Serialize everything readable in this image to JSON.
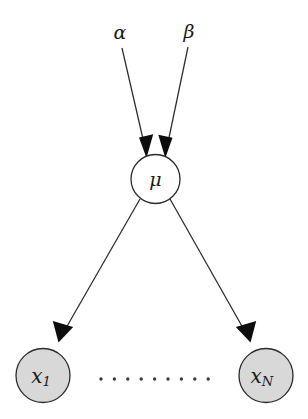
{
  "diagram": {
    "type": "directed-graphical-model",
    "background_color": "#ffffff",
    "stroke_color": "#2b2b2b",
    "arrow_color": "#0d0d0d",
    "shaded_node_fill": "#d8d8d8",
    "open_node_fill": "#ffffff"
  },
  "parameters": [
    {
      "id": "alpha",
      "label": "α",
      "x": 120,
      "y": 33,
      "font_size": 19
    },
    {
      "id": "beta",
      "label": "β",
      "x": 189,
      "y": 32,
      "font_size": 19
    }
  ],
  "nodes": [
    {
      "id": "mu",
      "label": "μ",
      "subscript": "",
      "cx": 155.5,
      "cy": 179,
      "r": 24.5,
      "shaded": false,
      "font_size": 19,
      "observed": false
    },
    {
      "id": "x1",
      "label": "x",
      "subscript": "1",
      "cx": 43,
      "cy": 375.5,
      "r": 27,
      "shaded": true,
      "font_size": 20,
      "observed": true
    },
    {
      "id": "xN",
      "label": "x",
      "subscript": "N",
      "cx": 266,
      "cy": 375.5,
      "r": 27,
      "shaded": true,
      "font_size": 20,
      "observed": true
    }
  ],
  "edges": [
    {
      "id": "alpha-to-mu",
      "from": "alpha",
      "to": "mu",
      "x1": 122,
      "y1": 48,
      "x2": 146,
      "y2": 156,
      "arrow": true
    },
    {
      "id": "beta-to-mu",
      "from": "beta",
      "to": "mu",
      "x1": 188,
      "y1": 47,
      "x2": 166,
      "y2": 156,
      "arrow": true
    },
    {
      "id": "mu-to-x1",
      "from": "mu",
      "to": "x1",
      "x1": 140,
      "y1": 199,
      "x2": 61,
      "y2": 337,
      "arrow": true
    },
    {
      "id": "mu-to-xN",
      "from": "mu",
      "to": "xN",
      "x1": 170,
      "y1": 199,
      "x2": 248,
      "y2": 337,
      "arrow": true
    }
  ],
  "ellipsis": {
    "id": "node-ellipsis",
    "label": "·········",
    "count": 9,
    "start_x": 101,
    "spacing": 13.4,
    "y": 379,
    "radius": 1.7
  }
}
